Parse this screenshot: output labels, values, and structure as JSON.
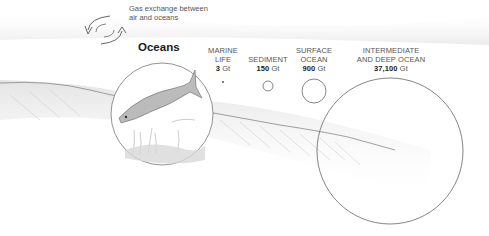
{
  "title": "Oceans",
  "gas_exchange": {
    "line1": "Gas exchange between",
    "line2": "air and oceans",
    "icon": "cycle-arrows-icon"
  },
  "reservoirs": [
    {
      "name_line1": "MARINE",
      "name_line2": "LIFE",
      "value": "3",
      "unit": "Gt",
      "circle": {
        "cx": 223,
        "cy": 82,
        "r": 1
      }
    },
    {
      "name_line1": "",
      "name_line2": "SEDIMENT",
      "value": "150",
      "unit": "Gt",
      "circle": {
        "cx": 268,
        "cy": 86,
        "r": 5
      }
    },
    {
      "name_line1": "SURFACE",
      "name_line2": "OCEAN",
      "value": "900",
      "unit": "Gt",
      "circle": {
        "cx": 314,
        "cy": 91,
        "r": 12
      }
    },
    {
      "name_line1": "INTERMEDIATE",
      "name_line2": "AND DEEP OCEAN",
      "value": "37,100",
      "unit": "Gt",
      "circle": {
        "cx": 390,
        "cy": 151,
        "r": 73
      }
    }
  ],
  "colors": {
    "stroke": "#666666",
    "text": "#555555",
    "bold_text": "#1a1a1a",
    "sketch": "#bbbbbb"
  }
}
